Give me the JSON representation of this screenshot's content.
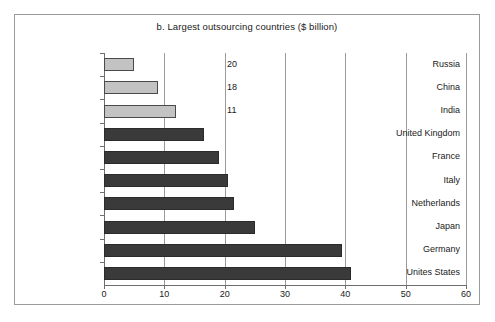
{
  "figure": {
    "title": "b. Largest outsourcing countries ($ billion)"
  },
  "chart_data": {
    "type": "bar",
    "orientation": "horizontal",
    "title": "b. Largest outsourcing countries ($ billion)",
    "xlabel": "",
    "ylabel": "",
    "xlim": [
      0,
      60
    ],
    "xticks": [
      0,
      10,
      20,
      30,
      40,
      50,
      60
    ],
    "xtick_labels": [
      "0",
      "10",
      "20",
      "30",
      "40",
      "50",
      "60"
    ],
    "grid": "vertical",
    "legend": "none",
    "categories": [
      "Russia",
      "China",
      "India",
      "United Kingdom",
      "France",
      "Italy",
      "Netherlands",
      "Japan",
      "Germany",
      "Unites States"
    ],
    "values": [
      5,
      9,
      12,
      16.5,
      19,
      20.5,
      21.5,
      25,
      39.5,
      41
    ],
    "bar_styles": [
      "light",
      "light",
      "light",
      "dark",
      "dark",
      "dark",
      "dark",
      "dark",
      "dark",
      "dark"
    ],
    "colors": {
      "light_bar_fill": "#c3c3c3",
      "light_bar_edge": "#4a4a4a",
      "dark_bar_fill": "#3a3a3a",
      "dark_bar_edge": "#2b2b2b",
      "axis": "#6e6e6e",
      "grid": "#9a9a9a",
      "frame": "#9a9a9a",
      "text": "#1a1a1a"
    },
    "annotations": [
      {
        "text": "20",
        "x": 20.4,
        "category": "Russia"
      },
      {
        "text": "18",
        "x": 20.4,
        "category": "China"
      },
      {
        "text": "11",
        "x": 20.4,
        "category": "India"
      }
    ]
  }
}
